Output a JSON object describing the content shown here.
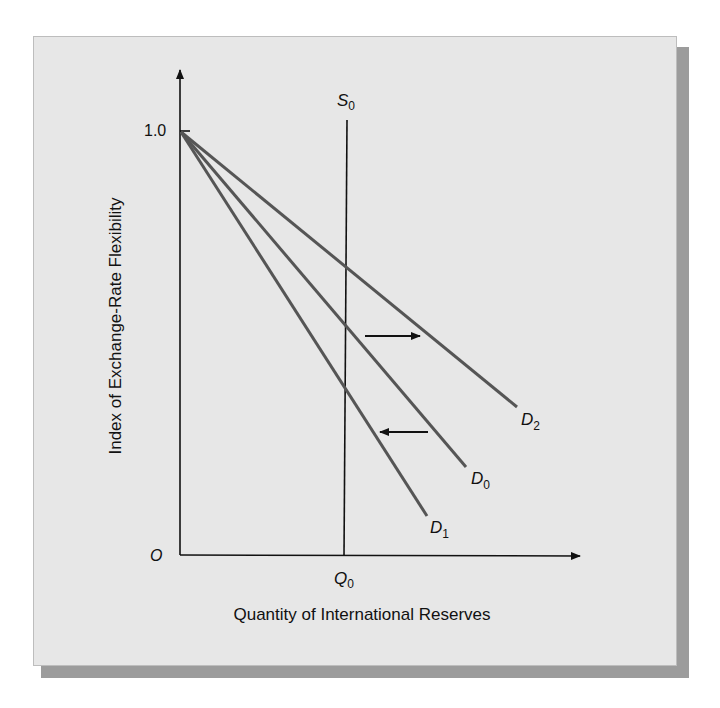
{
  "figure": {
    "y_axis_label": "Index of Exchange-Rate Flexibility",
    "x_axis_label": "Quantity of International Reserves",
    "y_tick_label": "1.0",
    "origin_label": "O",
    "supply_curve": {
      "label": "S",
      "subscript": "0"
    },
    "quantity_label": {
      "label": "Q",
      "subscript": "0"
    },
    "demand_curves": [
      {
        "label": "D",
        "subscript": "2"
      },
      {
        "label": "D",
        "subscript": "0"
      },
      {
        "label": "D",
        "subscript": "1"
      }
    ],
    "arrows": [
      {
        "direction": "right",
        "meaning": "shift from D0 to D2"
      },
      {
        "direction": "left",
        "meaning": "shift from D0 to D1"
      }
    ],
    "colors": {
      "panel_bg": "#e7e7e7",
      "shadow": "#9c9c9c",
      "axis": "#111111",
      "demand_line": "#555555"
    }
  }
}
